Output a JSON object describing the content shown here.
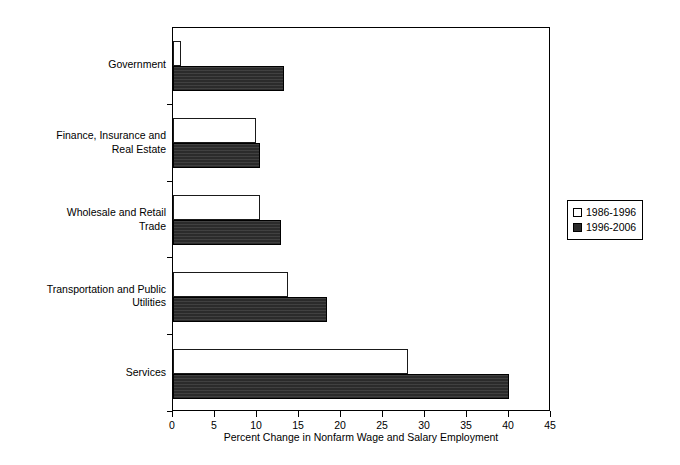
{
  "chart_data": {
    "type": "bar",
    "orientation": "horizontal",
    "title": "",
    "xlabel": "Percent Change in Nonfarm Wage and Salary Employment",
    "ylabel": "",
    "xlim": [
      0,
      45
    ],
    "xticks": [
      0,
      5,
      10,
      15,
      20,
      25,
      30,
      35,
      40,
      45
    ],
    "xticklabels": [
      "0",
      "5",
      "10",
      "15",
      "20",
      "25",
      "30",
      "35",
      "40",
      "45"
    ],
    "grid": false,
    "legend_position": "right",
    "categories": [
      "Government",
      "Finance, Insurance and\nReal Estate",
      "Wholesale and Retail\nTrade",
      "Transportation and Public\nUtilities",
      "Services"
    ],
    "series": [
      {
        "name": "1986-1996",
        "color": "#ffffff",
        "edge_color": "#1a1a1a",
        "values": [
          1.0,
          9.9,
          10.4,
          13.7,
          28.0
        ]
      },
      {
        "name": "1996-2006",
        "color": "#2b2b2b",
        "edge_color": "#000000",
        "values": [
          13.2,
          10.4,
          12.9,
          18.3,
          40.0
        ]
      }
    ]
  },
  "legend": {
    "entries": [
      {
        "label": "1986-1996"
      },
      {
        "label": "1996-2006"
      }
    ]
  },
  "axis": {
    "x_title": "Percent Change in Nonfarm Wage and Salary Employment"
  }
}
